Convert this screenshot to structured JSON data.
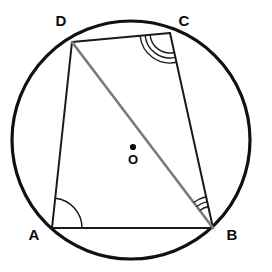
{
  "figure": {
    "background_color": "#ffffff"
  },
  "circle": {
    "name": "circumcircle",
    "center_x": 131,
    "center_y": 140,
    "radius": 119,
    "stroke_color": "#111111",
    "stroke_width": 3.2,
    "fill": "none"
  },
  "centre_point": {
    "label": "O",
    "dot_x": 133,
    "dot_y": 147,
    "dot_radius": 3.1,
    "label_x": 133,
    "label_y": 161,
    "color": "#0a0a0a"
  },
  "vertices": [
    {
      "label": "A",
      "x": 52,
      "y": 228,
      "label_x": 34,
      "label_y": 236
    },
    {
      "label": "B",
      "x": 213,
      "y": 228,
      "label_x": 232,
      "label_y": 236
    },
    {
      "label": "C",
      "x": 170,
      "y": 33,
      "label_x": 184,
      "label_y": 22
    },
    {
      "label": "D",
      "x": 72,
      "y": 42,
      "label_x": 61,
      "label_y": 22
    }
  ],
  "sides": [
    {
      "name": "side-AB",
      "from": "A",
      "to": "B",
      "x1": 52,
      "y1": 228,
      "x2": 213,
      "y2": 228,
      "stroke_color": "#1a1a1a",
      "stroke_width": 2.0
    },
    {
      "name": "side-BC",
      "from": "B",
      "to": "C",
      "x1": 213,
      "y1": 228,
      "x2": 170,
      "y2": 33,
      "stroke_color": "#1a1a1a",
      "stroke_width": 2.0
    },
    {
      "name": "side-CD",
      "from": "C",
      "to": "D",
      "x1": 170,
      "y1": 33,
      "x2": 72,
      "y2": 42,
      "stroke_color": "#1a1a1a",
      "stroke_width": 2.0
    },
    {
      "name": "side-DA",
      "from": "D",
      "to": "A",
      "x1": 72,
      "y1": 42,
      "x2": 52,
      "y2": 228,
      "stroke_color": "#1a1a1a",
      "stroke_width": 2.0
    }
  ],
  "diagonal": {
    "name": "diagonal-DB",
    "from": "D",
    "to": "B",
    "x1": 72,
    "y1": 42,
    "x2": 213,
    "y2": 228,
    "stroke_color": "#7a7a7a",
    "stroke_width": 2.6
  },
  "angle_marks": [
    {
      "name": "angle-mark-A",
      "at_vertex": "A",
      "arc_count": 1,
      "radii": [
        30
      ],
      "between": [
        "A->D",
        "A->B"
      ],
      "stroke_color": "#1a1a1a",
      "stroke_width": 1.5
    },
    {
      "name": "angle-mark-B",
      "at_vertex": "B",
      "arc_count": 3,
      "radii": [
        22,
        27,
        32
      ],
      "between": [
        "B->C",
        "B->D"
      ],
      "stroke_color": "#1a1a1a",
      "stroke_width": 1.4
    },
    {
      "name": "angle-mark-C",
      "at_vertex": "C",
      "arc_count": 3,
      "radii": [
        20,
        25,
        30
      ],
      "between": [
        "C->B",
        "C->D"
      ],
      "stroke_color": "#1a1a1a",
      "stroke_width": 1.4
    }
  ],
  "colors": {
    "ink": "#111111",
    "line": "#1a1a1a",
    "diagonal_gray": "#7a7a7a",
    "background": "#ffffff"
  }
}
